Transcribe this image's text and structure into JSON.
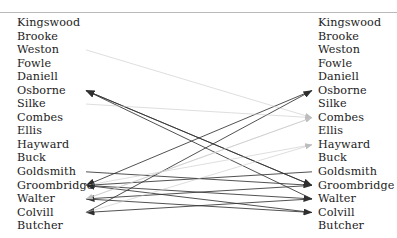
{
  "diagram": {
    "type": "bipartite-linkage",
    "title": "",
    "left_column_label": "",
    "right_column_label": "",
    "top_rule_visible": true,
    "colors": {
      "text": "#1c1c1c",
      "rule": "#b9b9b9",
      "strong_edge": "#333333",
      "weak_edge": "#c8c8c8",
      "background": "#ffffff"
    },
    "left_names": [
      "Kingswood",
      "Brooke",
      "Weston",
      "Fowle",
      "Daniell",
      "Osborne",
      "Silke",
      "Combes",
      "Ellis",
      "Hayward",
      "Buck",
      "Goldsmith",
      "Groombridge",
      "Walter",
      "Colvill",
      "Butcher"
    ],
    "right_names": [
      "Kingswood",
      "Brooke",
      "Weston",
      "Fowle",
      "Daniell",
      "Osborne",
      "Silke",
      "Combes",
      "Ellis",
      "Hayward",
      "Buck",
      "Goldsmith",
      "Groombridge",
      "Walter",
      "Colvill",
      "Butcher"
    ],
    "edges": [
      {
        "from_side": "right",
        "from": "Groombridge",
        "to_side": "left",
        "to": "Osborne",
        "weight": "strong"
      },
      {
        "from_side": "right",
        "from": "Walter",
        "to_side": "left",
        "to": "Osborne",
        "weight": "strong"
      },
      {
        "from_side": "left",
        "from": "Osborne",
        "to_side": "right",
        "to": "Groombridge",
        "weight": "strong"
      },
      {
        "from_side": "left",
        "from": "Goldsmith",
        "to_side": "right",
        "to": "Groombridge",
        "weight": "strong"
      },
      {
        "from_side": "right",
        "from": "Osborne",
        "to_side": "left",
        "to": "Groombridge",
        "weight": "strong"
      },
      {
        "from_side": "right",
        "from": "Goldsmith",
        "to_side": "left",
        "to": "Groombridge",
        "weight": "strong"
      },
      {
        "from_side": "right",
        "from": "Colvill",
        "to_side": "left",
        "to": "Groombridge",
        "weight": "strong"
      },
      {
        "from_side": "right",
        "from": "Groombridge",
        "to_side": "left",
        "to": "Walter",
        "weight": "strong"
      },
      {
        "from_side": "left",
        "from": "Groombridge",
        "to_side": "right",
        "to": "Walter",
        "weight": "strong"
      },
      {
        "from_side": "right",
        "from": "Walter",
        "to_side": "left",
        "to": "Colvill",
        "weight": "strong"
      },
      {
        "from_side": "left",
        "from": "Walter",
        "to_side": "right",
        "to": "Colvill",
        "weight": "strong"
      },
      {
        "from_side": "left",
        "from": "Colvill",
        "to_side": "right",
        "to": "Osborne",
        "weight": "strong"
      },
      {
        "from_side": "left",
        "from": "Weston",
        "to_side": "right",
        "to": "Combes",
        "weight": "weak"
      },
      {
        "from_side": "left",
        "from": "Silke",
        "to_side": "right",
        "to": "Combes",
        "weight": "weak"
      },
      {
        "from_side": "left",
        "from": "Groombridge",
        "to_side": "right",
        "to": "Hayward",
        "weight": "weak"
      },
      {
        "from_side": "left",
        "from": "Colvill",
        "to_side": "right",
        "to": "Hayward",
        "weight": "weak"
      },
      {
        "from_side": "left",
        "from": "Walter",
        "to_side": "right",
        "to": "Combes",
        "weight": "weak"
      },
      {
        "from_side": "right",
        "from": "Combes",
        "to_side": "left",
        "to": "Walter",
        "weight": "weak"
      }
    ]
  }
}
